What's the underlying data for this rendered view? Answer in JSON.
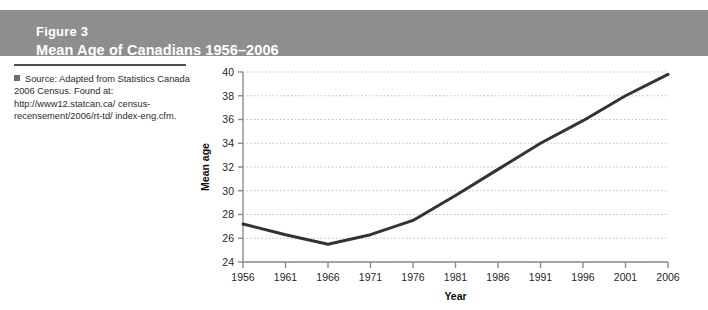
{
  "header": {
    "figure_number": "Figure 3",
    "title": "Mean Age of Canadians 1956–2006",
    "band_color": "#8e8e8e",
    "text_color": "#ffffff"
  },
  "source_note": {
    "bullet_icon": "square-bullet-icon",
    "line1": "Source: Adapted from Statistics",
    "line2": "Canada 2006 Census. Found at:",
    "line3": "http://www12.statcan.ca/",
    "line4": "census-recensement/2006/rt-td/",
    "line5": "index-eng.cfm."
  },
  "chart_data": {
    "type": "line",
    "title": "Mean Age of Canadians 1956–2006",
    "xlabel": "Year",
    "ylabel": "Mean age",
    "categories": [
      1956,
      1961,
      1966,
      1971,
      1976,
      1981,
      1986,
      1991,
      1996,
      2001,
      2006
    ],
    "x_tick_labels": [
      "1956",
      "1961",
      "1966",
      "1971",
      "1976",
      "1981",
      "1986",
      "1991",
      "1996",
      "2001",
      "2006"
    ],
    "values": [
      27.2,
      26.3,
      25.5,
      26.3,
      27.5,
      29.6,
      31.8,
      34.0,
      35.9,
      38.0,
      39.8
    ],
    "y_tick_labels": [
      "24",
      "26",
      "28",
      "30",
      "32",
      "34",
      "36",
      "38",
      "40"
    ],
    "y_ticks": [
      24,
      26,
      28,
      30,
      32,
      34,
      36,
      38,
      40
    ],
    "ylim": [
      24,
      40
    ],
    "xlim": [
      1956,
      2006
    ],
    "grid": "horizontal-dotted",
    "legend": "none",
    "line_color": "#333333",
    "line_width": 3,
    "grid_color": "#b9bcd0",
    "axis_color": "#8a8a8a"
  }
}
